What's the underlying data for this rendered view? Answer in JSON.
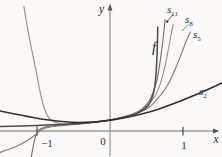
{
  "figure": {
    "background_color": "#faf9f7",
    "axis_color": "#9a9a9a",
    "label_color": "#2b2b2b",
    "labels": {
      "y_axis": "y",
      "x_axis": "x",
      "origin": "0",
      "tick_one": "1",
      "tick_neg_one": "−1",
      "f": "f",
      "s2": {
        "base": "s",
        "sub": "2"
      },
      "s5": {
        "base": "s",
        "sub": "5"
      },
      "s8": {
        "base": "s",
        "sub": "8"
      },
      "s11": {
        "base": "s",
        "sub": "11"
      }
    }
  },
  "chart_data": {
    "type": "line",
    "title": "",
    "xlabel": "x",
    "ylabel": "y",
    "xlim": [
      -1.55,
      1.55
    ],
    "ylim": [
      -2.6,
      11.5
    ],
    "x_ticks": [
      -1,
      1
    ],
    "grid": false,
    "legend_position": "inline-labels",
    "layout": {
      "origin_px": [
        110,
        131
      ],
      "x_scale_px": 73,
      "y_scale_px": 11
    },
    "series": [
      {
        "name": "s8",
        "color": "#8e8e8e",
        "width": 1.1,
        "points": [
          [
            -1.18,
            11.3
          ],
          [
            -1.1,
            8.3
          ],
          [
            -1.01,
            5.4
          ],
          [
            -0.95,
            3.3
          ],
          [
            -0.88,
            1.7
          ],
          [
            -0.8,
            0.95
          ],
          [
            -0.65,
            0.62
          ],
          [
            -0.4,
            0.68
          ],
          [
            0,
            1
          ],
          [
            0.3,
            1.5
          ],
          [
            0.45,
            2.0
          ],
          [
            0.58,
            2.8
          ],
          [
            0.68,
            4.1
          ],
          [
            0.76,
            6.1
          ],
          [
            0.82,
            8.2
          ],
          [
            0.865,
            9.7
          ]
        ]
      },
      {
        "name": "s5",
        "color": "#7d7d7d",
        "width": 1.1,
        "points": [
          [
            -1.51,
            -1.95
          ],
          [
            -1.3,
            -1.45
          ],
          [
            -1.12,
            -0.82
          ],
          [
            -1.01,
            -0.27
          ],
          [
            -0.93,
            0.14
          ],
          [
            -0.82,
            0.36
          ],
          [
            -0.6,
            0.52
          ],
          [
            -0.3,
            0.72
          ],
          [
            0,
            1
          ],
          [
            0.3,
            1.5
          ],
          [
            0.5,
            2.0
          ],
          [
            0.65,
            2.9
          ],
          [
            0.8,
            4.3
          ],
          [
            0.93,
            6.2
          ],
          [
            1.04,
            8.1
          ],
          [
            1.1,
            9.0
          ]
        ]
      },
      {
        "name": "s11",
        "color": "#6f6f6f",
        "width": 1.1,
        "points": [
          [
            -1.08,
            -2.4
          ],
          [
            -1.05,
            -1.35
          ],
          [
            -1.02,
            -0.5
          ],
          [
            -0.99,
            0.0
          ],
          [
            -0.95,
            0.2
          ],
          [
            -0.85,
            0.42
          ],
          [
            -0.7,
            0.52
          ],
          [
            -0.45,
            0.65
          ],
          [
            -0.2,
            0.8
          ],
          [
            0,
            1
          ],
          [
            0.3,
            1.5
          ],
          [
            0.45,
            2.05
          ],
          [
            0.55,
            2.9
          ],
          [
            0.63,
            4.3
          ],
          [
            0.68,
            6.0
          ],
          [
            0.72,
            8.0
          ],
          [
            0.755,
            10.1
          ]
        ]
      },
      {
        "name": "f",
        "color": "#4f4a46",
        "width": 1.5,
        "points": [
          [
            -1.51,
            0.4
          ],
          [
            -1.2,
            0.45
          ],
          [
            -1.0,
            0.5
          ],
          [
            -0.7,
            0.59
          ],
          [
            -0.4,
            0.71
          ],
          [
            -0.15,
            0.87
          ],
          [
            0,
            1
          ],
          [
            0.2,
            1.25
          ],
          [
            0.35,
            1.54
          ],
          [
            0.45,
            1.9
          ],
          [
            0.52,
            2.3
          ],
          [
            0.57,
            2.9
          ],
          [
            0.61,
            3.9
          ],
          [
            0.63,
            5.2
          ],
          [
            0.645,
            7.0
          ],
          [
            0.655,
            9.45
          ]
        ]
      },
      {
        "name": "s2",
        "color": "#2e2e2e",
        "width": 1.5,
        "points": [
          [
            -1.51,
            1.82
          ],
          [
            -0.89,
            1.05
          ],
          [
            -0.52,
            0.79
          ],
          [
            -0.21,
            0.82
          ],
          [
            0,
            0.97
          ],
          [
            0.27,
            1.29
          ],
          [
            0.55,
            1.75
          ],
          [
            0.82,
            2.36
          ],
          [
            1.1,
            3.09
          ],
          [
            1.37,
            3.86
          ],
          [
            1.53,
            4.36
          ]
        ]
      }
    ]
  }
}
